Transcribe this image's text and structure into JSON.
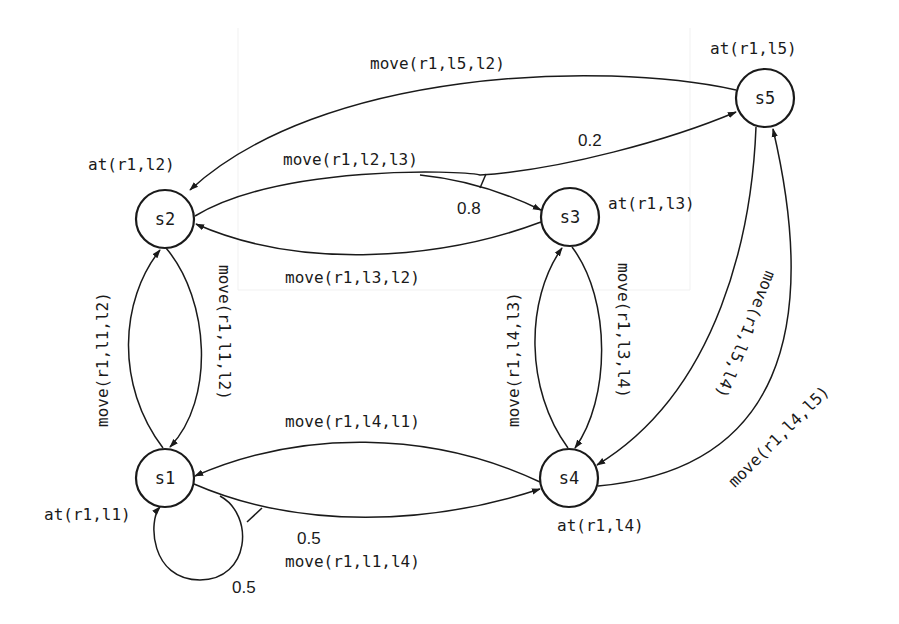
{
  "diagram": {
    "type": "state-transition-graph",
    "nodes": [
      {
        "id": "s1",
        "label": "s1",
        "state": "at(r1,l1)"
      },
      {
        "id": "s2",
        "label": "s2",
        "state": "at(r1,l2)"
      },
      {
        "id": "s3",
        "label": "s3",
        "state": "at(r1,l3)"
      },
      {
        "id": "s4",
        "label": "s4",
        "state": "at(r1,l4)"
      },
      {
        "id": "s5",
        "label": "s5",
        "state": "at(r1,l5)"
      }
    ],
    "edges": [
      {
        "from": "s5",
        "to": "s2",
        "action": "move(r1,l5,l2)"
      },
      {
        "from": "s2",
        "to": "s3",
        "action": "move(r1,l2,l3)",
        "probability": "0.8"
      },
      {
        "from": "s2",
        "to": "s5",
        "action": "move(r1,l2,l3)",
        "probability": "0.2"
      },
      {
        "from": "s3",
        "to": "s2",
        "action": "move(r1,l3,l2)"
      },
      {
        "from": "s1",
        "to": "s2",
        "action": "move(r1,l1,l2)"
      },
      {
        "from": "s2",
        "to": "s1",
        "action": "move(r1,l1,l2)"
      },
      {
        "from": "s4",
        "to": "s3",
        "action": "move(r1,l4,l3)"
      },
      {
        "from": "s3",
        "to": "s4",
        "action": "move(r1,l3,l4)"
      },
      {
        "from": "s5",
        "to": "s4",
        "action": "move(r1,l5,l4)"
      },
      {
        "from": "s4",
        "to": "s5",
        "action": "move(r1,l4,l5)"
      },
      {
        "from": "s4",
        "to": "s1",
        "action": "move(r1,l4,l1)"
      },
      {
        "from": "s1",
        "to": "s4",
        "action": "move(r1,l1,l4)",
        "probability": "0.5"
      },
      {
        "from": "s1",
        "to": "s1",
        "action": "move(r1,l1,l4)",
        "probability": "0.5"
      }
    ]
  },
  "labels": {
    "s1": "s1",
    "s2": "s2",
    "s3": "s3",
    "s4": "s4",
    "s5": "s5",
    "at_s1": "at(r1,l1)",
    "at_s2": "at(r1,l2)",
    "at_s3": "at(r1,l3)",
    "at_s4": "at(r1,l4)",
    "at_s5": "at(r1,l5)",
    "move_15_12": "move(r1,l5,l2)",
    "move_12_13": "move(r1,l2,l3)",
    "move_13_12": "move(r1,l3,l2)",
    "move_11_12_up": "move(r1,l1,l2)",
    "move_11_12_down": "move(r1,l1,l2)",
    "move_14_13": "move(r1,l4,l3)",
    "move_13_14": "move(r1,l3,l4)",
    "move_15_14": "move(r1,l5,l4)",
    "move_14_15": "move(r1,l4,l5)",
    "move_14_11": "move(r1,l4,l1)",
    "move_11_14": "move(r1,l1,l4)",
    "p_02": "0.2",
    "p_08": "0.8",
    "p_05_edge": "0.5",
    "p_05_loop": "0.5"
  }
}
